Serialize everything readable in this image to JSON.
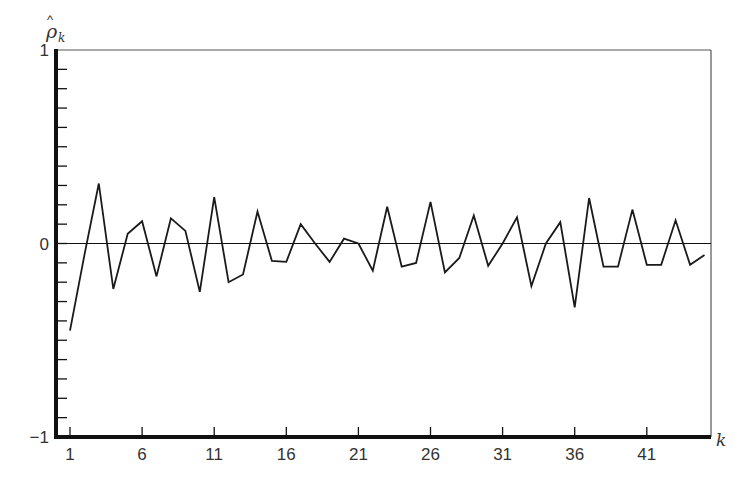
{
  "chart_data": {
    "type": "line",
    "title": "",
    "ylabel": "ρ̂_k",
    "ylabel_main": "ρ",
    "ylabel_sub": "k",
    "xlabel": "k",
    "ylim": [
      -1,
      1
    ],
    "xlim": [
      1,
      45
    ],
    "y_tick_labels": [
      "1",
      "0",
      "-1"
    ],
    "y_tick_values": [
      1,
      0,
      -1
    ],
    "y_minor_tick_step": 0.1,
    "x_tick_labels": [
      "1",
      "6",
      "11",
      "16",
      "21",
      "26",
      "31",
      "36",
      "41"
    ],
    "x_tick_values": [
      1,
      6,
      11,
      16,
      21,
      26,
      31,
      36,
      41
    ],
    "grid": false,
    "zero_line": true,
    "legend": null,
    "x": [
      1,
      2,
      3,
      4,
      5,
      6,
      7,
      8,
      9,
      10,
      11,
      12,
      13,
      14,
      15,
      16,
      17,
      18,
      19,
      20,
      21,
      22,
      23,
      24,
      25,
      26,
      27,
      28,
      29,
      30,
      31,
      32,
      33,
      34,
      35,
      36,
      37,
      38,
      39,
      40,
      41,
      42,
      43,
      44,
      45
    ],
    "series": [
      {
        "name": "sample autocorrelation",
        "values": [
          -0.45,
          -0.06,
          0.31,
          -0.235,
          0.05,
          0.115,
          -0.17,
          0.13,
          0.065,
          -0.25,
          0.24,
          -0.2,
          -0.16,
          0.165,
          -0.09,
          -0.095,
          0.1,
          0.0,
          -0.095,
          0.025,
          0.0,
          -0.14,
          0.19,
          -0.12,
          -0.1,
          0.215,
          -0.15,
          -0.075,
          0.145,
          -0.115,
          0.0,
          0.135,
          -0.22,
          0.0,
          0.11,
          -0.33,
          0.235,
          -0.12,
          -0.12,
          0.175,
          -0.11,
          -0.11,
          0.12,
          -0.11,
          -0.06
        ]
      }
    ]
  },
  "colors": {
    "line": "#1a1a1a",
    "axis": "#111111",
    "frame": "#555555",
    "text": "#333333"
  }
}
